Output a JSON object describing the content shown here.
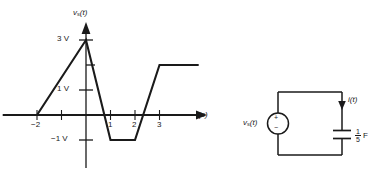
{
  "figure": {
    "plot": {
      "y_axis_label": "v",
      "y_axis_label_sub": "s",
      "y_axis_label_tail": "(t)",
      "x_axis_label": "t(s)",
      "y_ticks": [
        {
          "value": 3,
          "label": "3 V"
        },
        {
          "value": 1,
          "label": "1 V"
        },
        {
          "value": -1,
          "label": "−1 V"
        }
      ],
      "x_ticks": [
        {
          "value": -2,
          "label": "−2"
        },
        {
          "value": -1,
          "label": ""
        },
        {
          "value": 1,
          "label": "1"
        },
        {
          "value": 2,
          "label": "2"
        },
        {
          "value": 3,
          "label": "3"
        }
      ],
      "unlabeled_y_tick_value": 2,
      "waveform_points": [
        {
          "t": -3.4,
          "v": 0
        },
        {
          "t": -2,
          "v": 0
        },
        {
          "t": 0,
          "v": 3
        },
        {
          "t": 1,
          "v": -1
        },
        {
          "t": 2,
          "v": -1
        },
        {
          "t": 3,
          "v": 2
        },
        {
          "t": 4.6,
          "v": 2
        }
      ],
      "xlim": [
        -3.5,
        4.8
      ],
      "ylim": [
        -1.8,
        3.6
      ],
      "line_color": "#1a1a1a",
      "axis_color": "#1a1a1a"
    },
    "circuit": {
      "source_label": "v",
      "source_label_sub": "s",
      "source_label_tail": "(t)",
      "source_plus": "+",
      "source_minus": "−",
      "current_label": "i(t)",
      "capacitor_numerator": "1",
      "capacitor_denominator": "5",
      "capacitor_unit": "F",
      "wire_color": "#1a1a1a"
    }
  }
}
